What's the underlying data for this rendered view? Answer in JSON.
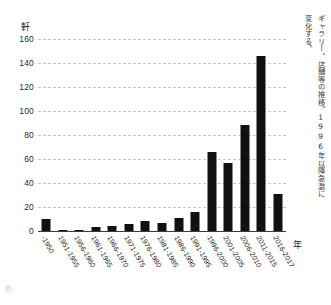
{
  "chart_data": {
    "type": "bar",
    "title": "",
    "xlabel": "年",
    "ylabel": "軒",
    "ylim": [
      0,
      160
    ],
    "yticks": [
      0,
      20,
      40,
      60,
      80,
      100,
      120,
      140,
      160
    ],
    "grid": true,
    "legend": "none",
    "bar_color": "#111111",
    "categories": [
      "-1950",
      "1951-1955",
      "1956-1960",
      "1961-1965",
      "1966-1970",
      "1971-1975",
      "1976-1980",
      "1981-1985",
      "1986-1990",
      "1991-1995",
      "1996-2000",
      "2001-2005",
      "2006-2010",
      "2011-2015",
      "2016-2017"
    ],
    "values": [
      10,
      1,
      1,
      3,
      4,
      6,
      8,
      7,
      11,
      16,
      66,
      57,
      88,
      146,
      31
    ],
    "annotations": [
      "ギャラリー、店舗等の推移。1996年以降急激に変化する。"
    ]
  },
  "axes": {
    "y_unit_label": "軒",
    "x_unit_label": "年",
    "y_tick_labels": [
      "160",
      "140",
      "120",
      "100",
      "80",
      "60",
      "40",
      "20",
      "0"
    ]
  },
  "caption": {
    "vertical_note": "ギャラリー、店舗等の推移。1996年以降急激に変化する。"
  },
  "page": {
    "mark": "⑪"
  }
}
